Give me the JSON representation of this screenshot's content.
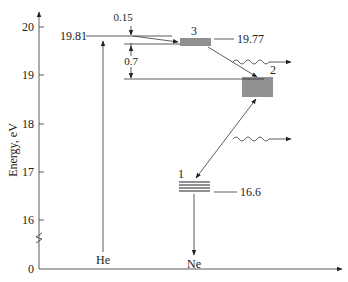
{
  "diagram": {
    "y_axis": {
      "label": "Energy, eV",
      "ticks": [
        {
          "value": "20",
          "y": 27
        },
        {
          "value": "19",
          "y": 75
        },
        {
          "value": "18",
          "y": 124
        },
        {
          "value": "17",
          "y": 172
        },
        {
          "value": "16",
          "y": 220
        },
        {
          "value": "0",
          "y": 269
        }
      ]
    },
    "atoms": {
      "he": "He",
      "ne": "Ne"
    },
    "levels": {
      "he_excited": "19.81",
      "ne_level3": "19.77",
      "ne_level1": "16.6"
    },
    "level_numbers": {
      "level1": "1",
      "level2": "2",
      "level3": "3"
    },
    "gaps": {
      "gap_small": "0.15",
      "gap_large": "0.7"
    },
    "colors": {
      "line": "#333333",
      "text": "#222222",
      "background": "#ffffff"
    }
  }
}
